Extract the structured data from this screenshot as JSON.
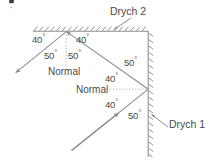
{
  "figure": {
    "title_glyph": "clipped-mark",
    "stroke_color": "#8c8c93",
    "text_color": "#4a4a4a",
    "background": "#ffffff",
    "mirrors": [
      {
        "name": "Drych 2",
        "orientation": "horizontal-top"
      },
      {
        "name": "Drych 1",
        "orientation": "vertical-right"
      }
    ],
    "normals": [
      {
        "label": "Normal",
        "at": "top-mirror",
        "style": "dotted-vertical"
      },
      {
        "label": "Normal",
        "at": "right-mirror",
        "style": "dotted-horizontal"
      }
    ],
    "angles": [
      {
        "value": "40",
        "unit": "°",
        "position": "top-left-of-incidence",
        "measured_from": "mirror-surface"
      },
      {
        "value": "40",
        "unit": "°",
        "position": "top-right-of-incidence",
        "measured_from": "mirror-surface"
      },
      {
        "value": "50",
        "unit": "°",
        "position": "left-of-top-normal",
        "measured_from": "normal"
      },
      {
        "value": "50",
        "unit": "°",
        "position": "right-of-top-normal",
        "measured_from": "normal"
      },
      {
        "value": "50",
        "unit": "°",
        "position": "above-right-mirror-point",
        "measured_from": "mirror-surface"
      },
      {
        "value": "40",
        "unit": "°",
        "position": "above-right-normal",
        "measured_from": "normal"
      },
      {
        "value": "40",
        "unit": "°",
        "position": "below-right-normal",
        "measured_from": "normal"
      },
      {
        "value": "50",
        "unit": "°",
        "position": "below-right-mirror-point",
        "measured_from": "mirror-surface"
      }
    ],
    "labels": {
      "mirror_top": "Drych 2",
      "mirror_right": "Drych 1",
      "normal_top": "Normal",
      "normal_right": "Normal",
      "angle_top_left": "40",
      "angle_top_right": "40",
      "angle_normal_left": "50",
      "angle_normal_right": "50",
      "angle_right_upper_surface": "50",
      "angle_right_upper_normal": "40",
      "angle_right_lower_normal": "40",
      "angle_right_lower_surface": "50",
      "degree_symbol": "°"
    },
    "rays": [
      {
        "name": "incident-ray",
        "from": "bottom-left",
        "to": "right-mirror-point",
        "arrow": "mid-ray"
      },
      {
        "name": "reflected-ray-1",
        "from": "right-mirror-point",
        "to": "top-mirror-point",
        "arrow": "at-end"
      },
      {
        "name": "reflected-ray-2",
        "from": "top-mirror-point",
        "to": "lower-left",
        "arrow": "at-end"
      },
      {
        "name": "leader-drych2",
        "from": "label",
        "to": "top-mirror",
        "arrow": "at-end"
      },
      {
        "name": "leader-drych1",
        "from": "label",
        "to": "right-mirror",
        "arrow": "at-end"
      }
    ]
  }
}
